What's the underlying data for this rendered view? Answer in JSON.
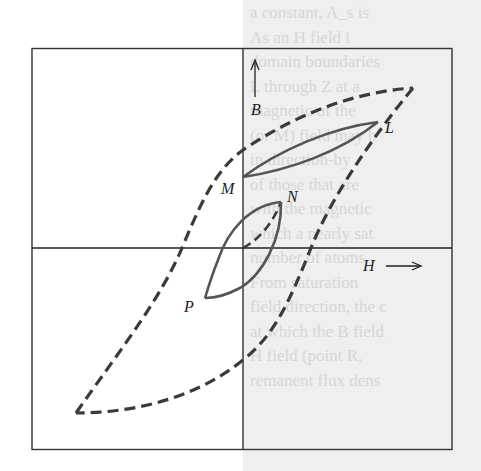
{
  "figure": {
    "type": "hysteresis-loop-diagram",
    "axes": {
      "vertical_label": "B",
      "horizontal_label": "H"
    },
    "points": [
      {
        "id": "L",
        "label": "L"
      },
      {
        "id": "M",
        "label": "M"
      },
      {
        "id": "N",
        "label": "N"
      },
      {
        "id": "P",
        "label": "P"
      }
    ],
    "curves": [
      {
        "name": "major-loop",
        "style": "dashed",
        "description": "Outer saturation hysteresis loop"
      },
      {
        "name": "minor-loop-LM",
        "style": "solid",
        "description": "Minor loop between L and M"
      },
      {
        "name": "minor-loop-NP",
        "style": "solid",
        "description": "Minor loop between N and P"
      },
      {
        "name": "initial-curve-ON",
        "style": "dashed",
        "description": "Initial magnetization from origin to N"
      }
    ],
    "colors": {
      "curve": "#3a3a3a",
      "axis": "#222222",
      "box": "#333333"
    }
  },
  "bleed_through_text": [
    "a constant, A_s is",
    "As an H field i",
    "domain boundaries",
    "L through Z at a",
    "magnetic of the",
    "(or M) field may b",
    "in direction-by",
    "of those that are",
    "with the magnetic",
    "which a nearly sat",
    "number of atoms",
    "From saturation",
    "field direction, the c",
    "at which the B field",
    "H field (point R,",
    "remanent flux dens"
  ]
}
